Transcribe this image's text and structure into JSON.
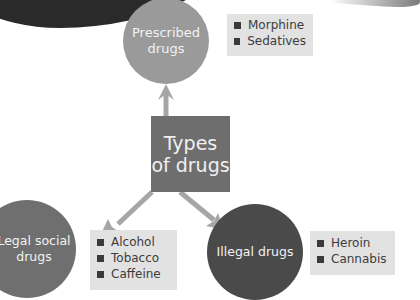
{
  "diagram": {
    "title": "Types of drugs",
    "center": {
      "line1": "Types",
      "line2": "of drugs",
      "color": "#6e6e6e"
    },
    "nodes": [
      {
        "label_line1": "Prescribed",
        "label_line2": "drugs",
        "color": "#9a9a9a",
        "items": [
          "Morphine",
          "Sedatives"
        ]
      },
      {
        "label_line1": "Legal social",
        "label_line2": "drugs",
        "color": "#6f6f6f",
        "items": [
          "Alcohol",
          "Tobacco",
          "Caffeine"
        ]
      },
      {
        "label_line1": "Illegal drugs",
        "label_line2": "",
        "color": "#4a4a4a",
        "items": [
          "Heroin",
          "Cannabis"
        ]
      }
    ],
    "arrow_color": "#a6a6a6",
    "listbox_color": "#e2e2e2"
  }
}
